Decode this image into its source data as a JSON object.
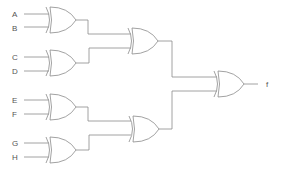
{
  "diagram": {
    "type": "logic-circuit",
    "gate_type": "XOR",
    "inputs": [
      {
        "label": "A",
        "x": 14,
        "y": 14
      },
      {
        "label": "B",
        "x": 14,
        "y": 28
      },
      {
        "label": "C",
        "x": 14,
        "y": 57
      },
      {
        "label": "D",
        "x": 14,
        "y": 71
      },
      {
        "label": "E",
        "x": 14,
        "y": 100
      },
      {
        "label": "F",
        "x": 14,
        "y": 114
      },
      {
        "label": "G",
        "x": 14,
        "y": 143
      },
      {
        "label": "H",
        "x": 14,
        "y": 157
      }
    ],
    "output": {
      "label": "f"
    },
    "gates": [
      {
        "id": "xor-ab",
        "inputs": [
          "A",
          "B"
        ]
      },
      {
        "id": "xor-cd",
        "inputs": [
          "C",
          "D"
        ]
      },
      {
        "id": "xor-ef",
        "inputs": [
          "E",
          "F"
        ]
      },
      {
        "id": "xor-gh",
        "inputs": [
          "G",
          "H"
        ]
      },
      {
        "id": "xor-abcd",
        "inputs": [
          "xor-ab",
          "xor-cd"
        ]
      },
      {
        "id": "xor-efgh",
        "inputs": [
          "xor-ef",
          "xor-gh"
        ]
      },
      {
        "id": "xor-final",
        "inputs": [
          "xor-abcd",
          "xor-efgh"
        ],
        "output": "f"
      }
    ],
    "colors": {
      "line": "#8a8a8a",
      "text": "#555555",
      "background": "#ffffff"
    }
  }
}
